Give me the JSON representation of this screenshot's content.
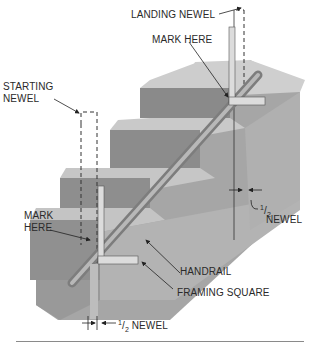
{
  "labels": {
    "landing_newel": "LANDING NEWEL",
    "mark_here_top": "MARK HERE",
    "starting_newel_line1": "STARTING",
    "starting_newel_line2": "NEWEL",
    "mark_here_left_line1": "MARK",
    "mark_here_left_line2": "HERE",
    "handrail": "HANDRAIL",
    "framing_square": "FRAMING SQUARE",
    "half_newel_right_frac_num": "1",
    "half_newel_right_frac_den": "2",
    "half_newel_right_word": "NEWEL",
    "half_newel_bottom_frac_num": "1",
    "half_newel_bottom_frac_den": "2",
    "half_newel_bottom_word": "NEWEL"
  },
  "colors": {
    "tread_top": "#c9c9c9",
    "riser": "#8f8f8f",
    "stringer": "#a9a9a9",
    "handrail": "#9c9c9c",
    "square": "#d8d8d8",
    "text": "#2a2a2a"
  }
}
